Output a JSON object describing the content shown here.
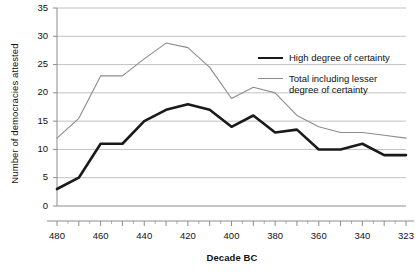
{
  "chart_data": {
    "type": "line",
    "title": "",
    "xlabel": "Decade BC",
    "ylabel": "Number of democracies attested",
    "ylim": [
      0,
      35
    ],
    "yticks": [
      0,
      5,
      10,
      15,
      20,
      25,
      30,
      35
    ],
    "grid": true,
    "legend_position": "right-inside",
    "x": [
      480,
      470,
      460,
      450,
      440,
      430,
      420,
      410,
      400,
      390,
      380,
      370,
      360,
      350,
      340,
      330,
      323
    ],
    "xticklabels": [
      "480",
      "460",
      "440",
      "420",
      "400",
      "380",
      "360",
      "340",
      "323"
    ],
    "xtick_values": [
      480,
      460,
      440,
      420,
      400,
      380,
      360,
      340,
      323
    ],
    "series": [
      {
        "name": "High degree of certainty",
        "color": "#1a1a1a",
        "values": [
          3,
          5,
          11,
          11,
          15,
          17,
          18,
          17,
          14,
          16,
          13,
          13.5,
          10,
          10,
          11,
          9,
          9
        ]
      },
      {
        "name": "Total including lesser degree of certainty",
        "color": "#8c8c8c",
        "values": [
          12,
          15.5,
          23,
          23,
          26,
          28.8,
          28,
          24.5,
          19,
          21,
          20,
          16,
          14,
          13,
          13,
          12.5,
          12
        ]
      }
    ]
  },
  "legend": {
    "items": [
      {
        "label": "High degree of certainty"
      },
      {
        "label": "Total including lesser degree of certainty"
      }
    ],
    "item_lines": [
      [
        "High degree of certainty"
      ],
      [
        "Total including lesser",
        "degree of certainty"
      ]
    ]
  },
  "axes": {
    "y_title": "Number of democracies attested",
    "x_title": "Decade BC",
    "y_tick_labels": [
      "35",
      "30",
      "25",
      "20",
      "15",
      "10",
      "5",
      "0"
    ],
    "x_tick_labels": [
      "480",
      "460",
      "440",
      "420",
      "400",
      "380",
      "360",
      "340",
      "323"
    ]
  },
  "colors": {
    "high_certainty": "#1a1a1a",
    "total": "#8c8c8c",
    "grid": "#b3b3b3",
    "axis": "#8c8c8c",
    "text": "#111111"
  }
}
